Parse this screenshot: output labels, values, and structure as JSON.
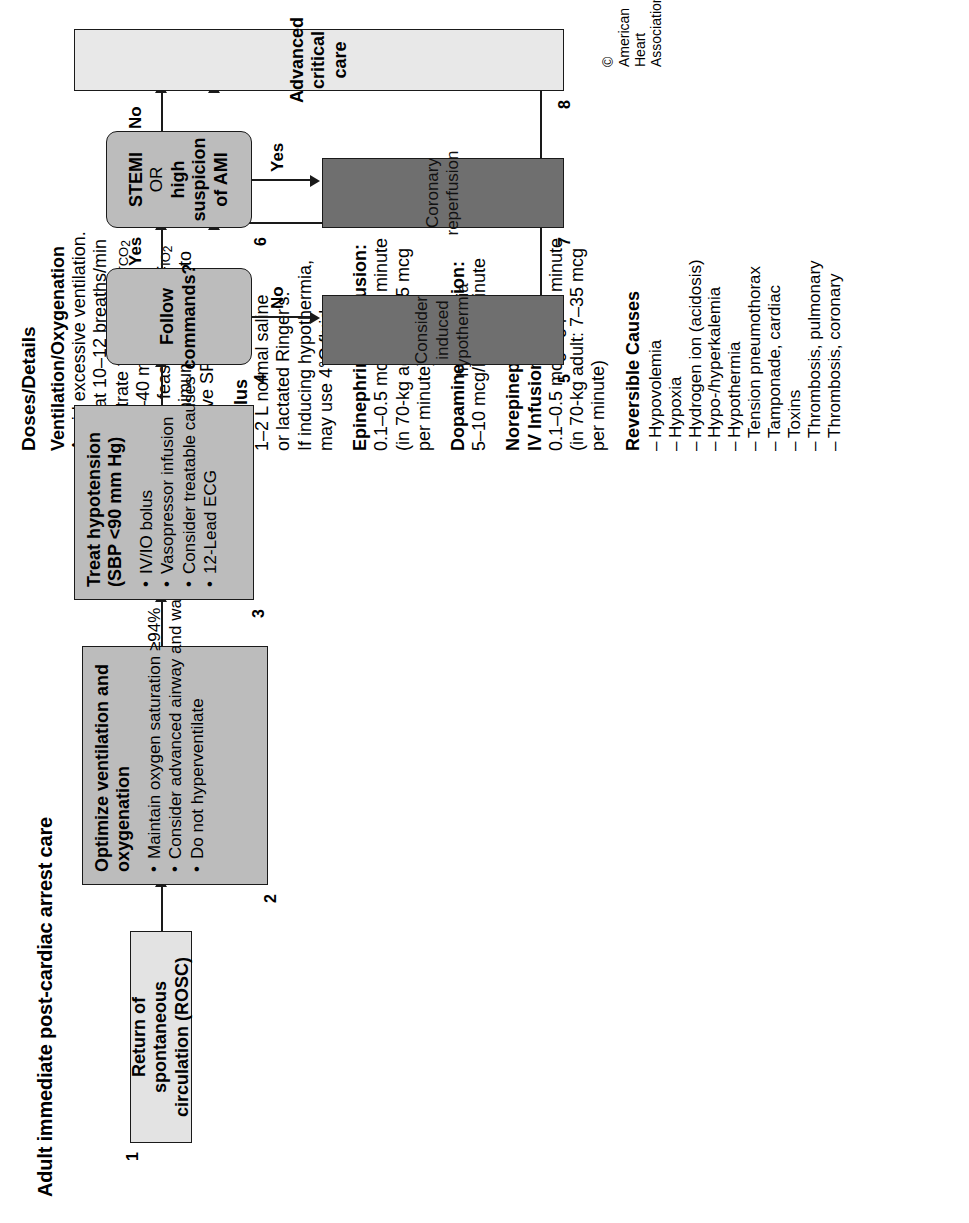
{
  "page_title": "Adult immediate post-cardiac arrest care",
  "copyright": "© American Heart Association",
  "doses": {
    "column_title": "Doses/Details",
    "sections": [
      {
        "heading": "Ventilation/Oxygenation",
        "lines": [
          "Avoid excessive ventilation.",
          "Start at 10–12 breaths/min",
          "and titrate to target PETCO2",
          "of 35–40 mm Hg.",
          "When feasible, titrate FIO2",
          "to minimum necessary to",
          "achieve SPO2≥94%."
        ]
      },
      {
        "heading": "IV Bolus",
        "lines": [
          "1–2 L normal saline",
          "or lactated Ringer's.",
          "If inducing hypothermia,",
          "may use 4°C fluid."
        ]
      },
      {
        "heading": "Epinephrine IV Infusion:",
        "lines": [
          "0.1–0.5 mcg/kg per minute",
          "(in 70-kg adult: 7–35 mcg",
          "per minute)"
        ]
      },
      {
        "heading": "Dopamine IV Infusion:",
        "lines": [
          "5–10 mcg/kg per minute"
        ]
      },
      {
        "heading": "Norepinephrine\nIV Infusion:",
        "heading_lines": [
          "Norepinephrine",
          "IV Infusion:"
        ],
        "lines": [
          "0.1–0.5 mcg/kg per minute",
          "(in 70-kg adult: 7–35 mcg",
          "per minute)"
        ]
      }
    ],
    "reversible": {
      "heading": "Reversible Causes",
      "items": [
        "Hypovolemia",
        "Hypoxia",
        "Hydrogen ion (acidosis)",
        "Hypo-/hyperkalemia",
        "Hypothermia",
        "Tension pneumothorax",
        "Tamponade, cardiac",
        "Toxins",
        "Thrombosis, pulmonary",
        "Thrombosis, coronary"
      ]
    }
  },
  "flow": {
    "boxes": [
      {
        "number": "1",
        "title": "Return of spontaneous circulation (ROSC)",
        "bullets": [],
        "shade": "#e3e3e3"
      },
      {
        "number": "2",
        "title": "Optimize ventilation and oxygenation",
        "bullets": [
          "Maintain oxygen saturation ≥94%",
          "Consider advanced airway and waveform capnography",
          "Do not hyperventilate"
        ],
        "shade": "#bcbcbc"
      },
      {
        "number": "3",
        "title": "Treat hypotension (SBP <90 mm Hg)",
        "bullets": [
          "IV/IO bolus",
          "Vasopressor infusion",
          "Consider treatable causes",
          "12-Lead ECG"
        ],
        "shade": "#bcbcbc"
      },
      {
        "number": "4",
        "title": "Follow commands?",
        "title_lines": [
          "Follow",
          "commands?"
        ],
        "bullets": [],
        "shade": "#bcbcbc"
      },
      {
        "number": "5",
        "title": "Consider induced hypothermia",
        "bullets": [],
        "shade": "#6f6f6f"
      },
      {
        "number": "6",
        "title": "STEMI OR high suspicion of AMI",
        "title_lines": [
          "STEMI",
          "OR",
          "high suspicion of AMI"
        ],
        "bullets": [],
        "shade": "#bcbcbc"
      },
      {
        "number": "7",
        "title": "Coronary reperfusion",
        "bullets": [],
        "shade": "#6f6f6f"
      },
      {
        "number": "8",
        "title": "Advanced critical care",
        "bullets": [],
        "shade": "#e8e8e8"
      }
    ],
    "edge_labels": {
      "no_from_4": "No",
      "yes_from_4": "Yes",
      "yes_from_6": "Yes",
      "no_from_6": "No"
    }
  }
}
